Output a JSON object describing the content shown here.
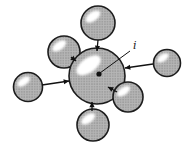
{
  "figure": {
    "label": {
      "text": "i",
      "x": 133,
      "y": 49
    },
    "center_dot": {
      "x": 99,
      "y": 74,
      "r": 2.6
    },
    "leader_line": {
      "x1": 130,
      "y1": 51,
      "x2": 100,
      "y2": 73
    },
    "spheres": [
      {
        "name": "sphere-upper-left",
        "cx": 64,
        "cy": 52,
        "r": 16
      },
      {
        "name": "sphere-top",
        "cx": 98,
        "cy": 23,
        "r": 17
      },
      {
        "name": "sphere-left",
        "cx": 28,
        "cy": 87,
        "r": 14.5
      },
      {
        "name": "sphere-right",
        "cx": 167,
        "cy": 63,
        "r": 13.5
      },
      {
        "name": "sphere-bottom",
        "cx": 93,
        "cy": 125,
        "r": 16
      },
      {
        "name": "sphere-central",
        "cx": 97,
        "cy": 76,
        "r": 28
      },
      {
        "name": "sphere-lower-right",
        "cx": 128,
        "cy": 97,
        "r": 15
      }
    ],
    "bonds": [
      {
        "name": "bond-top",
        "x1": 98,
        "y1": 40,
        "x2": 97,
        "y2": 51,
        "arrow": true
      },
      {
        "name": "bond-upper-left",
        "x1": 71,
        "y1": 57,
        "x2": 76,
        "y2": 61,
        "arrow": true
      },
      {
        "name": "bond-left",
        "x1": 42,
        "y1": 85,
        "x2": 69,
        "y2": 81,
        "arrow": true
      },
      {
        "name": "bond-right",
        "x1": 153,
        "y1": 64,
        "x2": 125,
        "y2": 68,
        "arrow": true
      },
      {
        "name": "bond-lower-right",
        "x1": 117,
        "y1": 92,
        "x2": 108,
        "y2": 87,
        "arrow": true
      },
      {
        "name": "bond-bottom",
        "x1": 92,
        "y1": 111,
        "x2": 92,
        "y2": 102,
        "arrow": true
      }
    ],
    "colors": {
      "background": "#ffffff",
      "sphere_fill": "#b6b6b6",
      "sphere_dots": "#7e7e7e",
      "outline": "#1c1c1c",
      "line": "#111111",
      "highlight": "#ffffff"
    }
  }
}
